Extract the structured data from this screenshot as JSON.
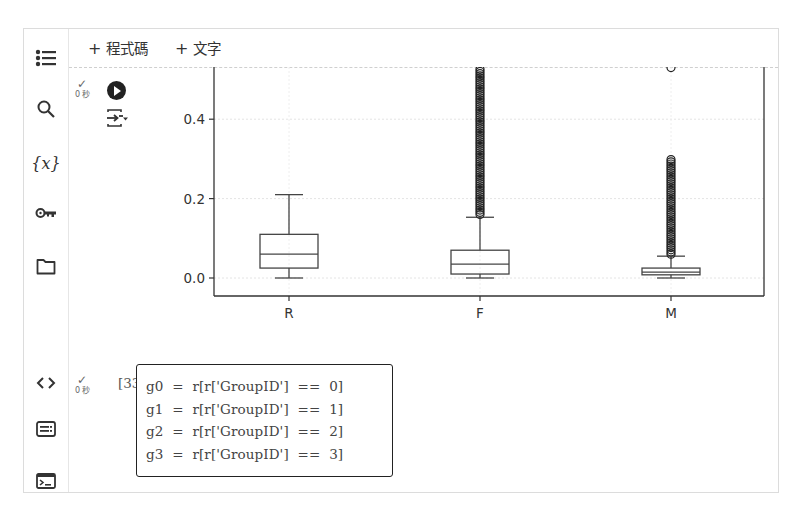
{
  "toolbar": {
    "add_code_label": "程式碼",
    "add_text_label": "文字",
    "plus": "+"
  },
  "sidebar": {
    "items": [
      {
        "name": "table-of-contents",
        "icon": "list-icon"
      },
      {
        "name": "search",
        "icon": "search-icon"
      },
      {
        "name": "variables",
        "icon": "variables-icon",
        "glyph": "{x}"
      },
      {
        "name": "secrets",
        "icon": "key-icon"
      },
      {
        "name": "files",
        "icon": "folder-icon"
      },
      {
        "name": "code-snippets",
        "icon": "code-icon",
        "glyph": "<>"
      },
      {
        "name": "command-palette",
        "icon": "command-palette-icon"
      },
      {
        "name": "terminal",
        "icon": "terminal-icon"
      }
    ]
  },
  "cells": [
    {
      "status_check": "✓",
      "exec_time": "0 秒",
      "run_icon": "play-circle-icon",
      "output_icon": "output-toggle-icon"
    },
    {
      "status_check": "✓",
      "exec_time": "0 秒",
      "exec_count": "[33]",
      "code_lines": [
        "g0  =  r[r['GroupID']  ==  0]",
        "g1  =  r[r['GroupID']  ==  1]",
        "g2  =  r[r['GroupID']  ==  2]",
        "g3  =  r[r['GroupID']  ==  3]"
      ]
    }
  ],
  "chart_data": {
    "type": "box",
    "title": "",
    "xlabel": "",
    "ylabel": "",
    "categories": [
      "R",
      "F",
      "M"
    ],
    "y_ticks": [
      "0.0",
      "0.2",
      "0.4"
    ],
    "ylim": [
      -0.05,
      0.53
    ],
    "grid": true,
    "boxes": [
      {
        "name": "R",
        "whisker_low": 0.0,
        "q1": 0.025,
        "median": 0.06,
        "q3": 0.11,
        "whisker_high": 0.21,
        "outliers_range": null
      },
      {
        "name": "F",
        "whisker_low": 0.0,
        "q1": 0.01,
        "median": 0.035,
        "q3": 0.07,
        "whisker_high": 0.153,
        "outliers_range": [
          0.16,
          0.53
        ]
      },
      {
        "name": "M",
        "whisker_low": 0.0,
        "q1": 0.008,
        "median": 0.015,
        "q3": 0.025,
        "whisker_high": 0.055,
        "outliers_range": [
          0.06,
          0.3
        ],
        "extra_outliers": [
          0.53
        ]
      }
    ]
  }
}
